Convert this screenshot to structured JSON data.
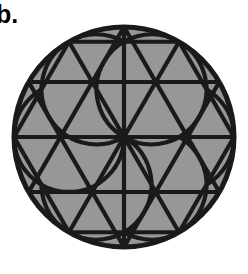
{
  "figure": {
    "label": "b.",
    "background_color": "#ffffff",
    "stroke_color": "#1a1a1a",
    "shade_color": "#979797",
    "white_fill": "#ffffff",
    "stroke_width": 4.2,
    "circle": {
      "center_x": 124,
      "center_y": 137,
      "radius": 110
    },
    "hexagram": {
      "up_triangle_rotation_deg": -90,
      "down_triangle_rotation_deg": 90,
      "point_count": 6
    },
    "rosette": {
      "petal_count": 6,
      "petal_fill": "#979797"
    },
    "shaded_regions": [
      "circle-segments",
      "star-points",
      "rosette-petals"
    ],
    "unshaded_regions": [
      "hexagon-triangles-outside-petals"
    ]
  }
}
